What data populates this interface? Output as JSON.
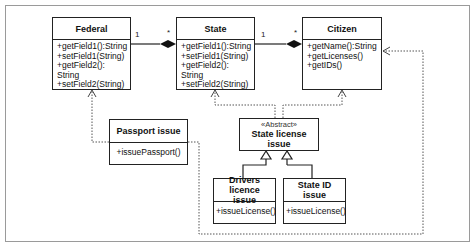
{
  "diagram": {
    "type": "UML class diagram",
    "classes": {
      "federal": {
        "name": "Federal",
        "methods": [
          "+getField1():String",
          "+setField1(String)",
          "+getField2(): String",
          "+setField2(String)"
        ]
      },
      "state": {
        "name": "State",
        "methods": [
          "+getField1():String",
          "+setField1(String)",
          "+getField2(): String",
          "+setField2(String)"
        ]
      },
      "citizen": {
        "name": "Citizen",
        "methods": [
          "+getName():String",
          "+getLicenses()",
          "+getIDs()"
        ]
      },
      "passport_issue": {
        "name": "Passport issue",
        "methods": [
          "+issuePassport()"
        ]
      },
      "state_license_issue": {
        "stereotype": "«Abstract»",
        "name": "State license issue"
      },
      "drivers_licence_issue": {
        "name_line1": "Drivers licence",
        "name_line2": "issue",
        "methods": [
          "+issueLicense()"
        ]
      },
      "state_id_issue": {
        "name_line1": "State ID",
        "name_line2": "issue",
        "methods": [
          "+issueLicense()"
        ]
      }
    },
    "associations": [
      {
        "from": "Federal",
        "to": "State",
        "kind": "composition",
        "from_mult": "1",
        "to_mult": "*"
      },
      {
        "from": "State",
        "to": "Citizen",
        "kind": "composition",
        "from_mult": "1",
        "to_mult": "*"
      }
    ],
    "dependencies": [
      {
        "from": "Passport issue",
        "to": "Federal"
      },
      {
        "from": "Passport issue",
        "to": "Citizen"
      },
      {
        "from": "State license issue",
        "to": "State"
      },
      {
        "from": "State license issue",
        "to": "Citizen"
      }
    ],
    "generalizations": [
      {
        "child": "Drivers licence issue",
        "parent": "State license issue"
      },
      {
        "child": "State ID issue",
        "parent": "State license issue"
      }
    ],
    "colors": {
      "line": "#222222",
      "dotted": "#555555",
      "frame": "#9a9a9a"
    }
  }
}
